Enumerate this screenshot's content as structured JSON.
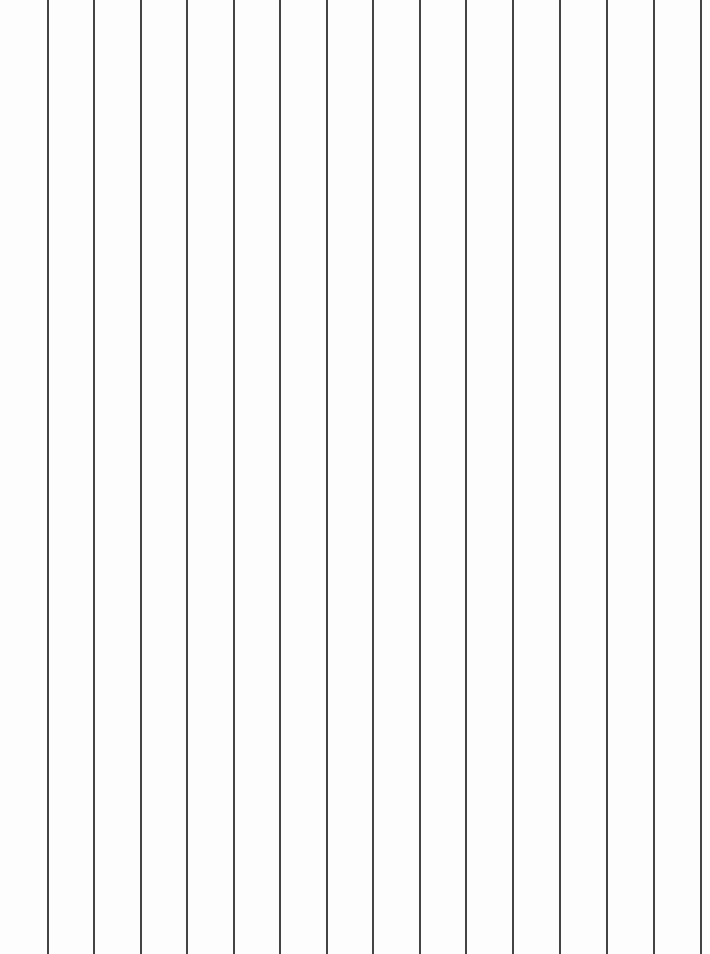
{
  "page": {
    "background": "#fdfdfd",
    "line_color": "#444444",
    "line_count": 15,
    "line_positions_px": [
      47,
      93,
      140,
      186,
      233,
      279,
      326,
      372,
      419,
      465,
      512,
      559,
      606,
      653,
      700
    ]
  }
}
